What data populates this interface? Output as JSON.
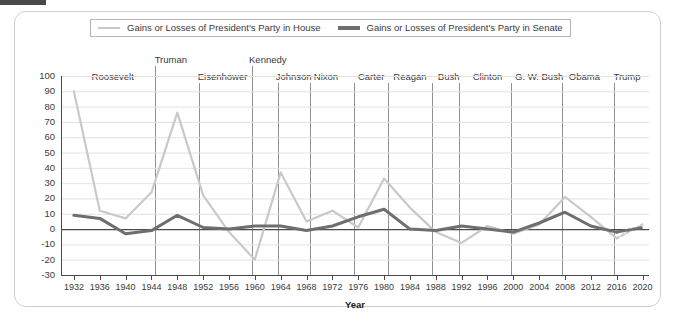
{
  "figure": {
    "corner_mark": "",
    "xaxis_title": "Year"
  },
  "legend": {
    "items": [
      {
        "label": "Gains or Losses of President's Party in House",
        "color": "#c9c9c9",
        "key": "house"
      },
      {
        "label": "Gains or Losses of President's Party in Senate",
        "color": "#6e6e6e",
        "key": "senate"
      }
    ]
  },
  "presidents": [
    {
      "name": "Roosevelt",
      "label_year": 1938.0,
      "row": 1,
      "divider_year": null
    },
    {
      "name": "Truman",
      "label_year": 1947.0,
      "row": 0,
      "divider_year": 1944.6
    },
    {
      "name": "Eisenhower",
      "label_year": 1955.0,
      "row": 1,
      "divider_year": 1951.4
    },
    {
      "name": "Kennedy",
      "label_year": 1962.0,
      "row": 0,
      "divider_year": 1959.6
    },
    {
      "name": "Johnson",
      "label_year": 1966.0,
      "row": 1,
      "divider_year": 1963.6
    },
    {
      "name": "Nixon",
      "label_year": 1971.0,
      "row": 1,
      "divider_year": 1968.6
    },
    {
      "name": "Carter",
      "label_year": 1978.0,
      "row": 1,
      "divider_year": 1975.4
    },
    {
      "name": "Reagan",
      "label_year": 1984.0,
      "row": 1,
      "divider_year": 1980.6
    },
    {
      "name": "Bush",
      "label_year": 1990.0,
      "row": 1,
      "divider_year": 1987.4
    },
    {
      "name": "Clinton",
      "label_year": 1996.0,
      "row": 1,
      "divider_year": 1991.6
    },
    {
      "name": "G. W. Bush",
      "label_year": 2004.0,
      "row": 1,
      "divider_year": 1999.6
    },
    {
      "name": "Obama",
      "label_year": 2011.0,
      "row": 1,
      "divider_year": 2007.6
    },
    {
      "name": "Trump",
      "label_year": 2017.6,
      "row": 1,
      "divider_year": 2015.6
    }
  ],
  "chart_data": {
    "type": "line",
    "title": "",
    "xlabel": "Year",
    "ylabel": "",
    "xlim": [
      1930,
      2021
    ],
    "ylim": [
      -30,
      100
    ],
    "ytick_step": 10,
    "grid": "horizontal",
    "legend_position": "top",
    "x": [
      1932,
      1936,
      1940,
      1944,
      1948,
      1952,
      1956,
      1960,
      1964,
      1968,
      1972,
      1976,
      1980,
      1984,
      1988,
      1992,
      1996,
      2000,
      2004,
      2008,
      2012,
      2016,
      2020
    ],
    "xticklabels": [
      "1932",
      "1936",
      "1940",
      "1944",
      "1948",
      "1952",
      "1956",
      "1960",
      "1964",
      "1968",
      "1972",
      "1976",
      "1980",
      "1984",
      "1988",
      "1992",
      "1996",
      "2000",
      "2004",
      "2008",
      "2012",
      "2016",
      "2020"
    ],
    "yticklabels": [
      "100",
      "90",
      "80",
      "70",
      "60",
      "50",
      "40",
      "30",
      "20",
      "10",
      "0",
      "-10",
      "-20",
      "-30"
    ],
    "series": [
      {
        "name": "Gains or Losses of President's Party in House",
        "key": "house",
        "color": "#c9c9c9",
        "width": 2.2,
        "values": [
          90,
          12,
          7,
          24,
          76,
          22,
          -2,
          -20,
          37,
          5,
          12,
          1,
          33,
          14,
          -2,
          -9,
          2,
          -3,
          3,
          21,
          8,
          -6,
          3
        ],
        "dashed_from_index": 21
      },
      {
        "name": "Gains or Losses of President's Party in Senate",
        "key": "senate",
        "color": "#6e6e6e",
        "width": 3.0,
        "values": [
          9,
          7,
          -3,
          -1,
          9,
          1,
          0,
          2,
          2,
          -1,
          2,
          8,
          13,
          0,
          -1,
          2,
          0,
          -2,
          4,
          11,
          2,
          -2,
          1
        ],
        "dashed_from_index": 21
      }
    ]
  }
}
